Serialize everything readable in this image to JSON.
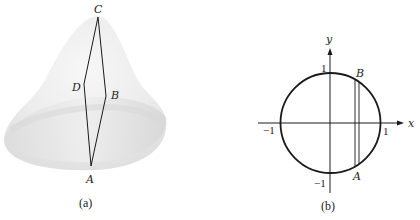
{
  "panel_a": {
    "caption": "(a)",
    "points": {
      "C": "C",
      "D": "D",
      "B": "B",
      "A": "A"
    }
  },
  "panel_b": {
    "caption": "(b)",
    "axes": {
      "x_label": "x",
      "y_label": "y"
    },
    "ticks": {
      "y_pos": "1",
      "y_neg": "−1",
      "x_pos": "1",
      "x_neg": "−1"
    },
    "points": {
      "B": "B",
      "A": "A"
    }
  },
  "colors": {
    "stroke": "#1a1a1a",
    "surface_light": "#f2f2f2",
    "surface_shade": "#dcdcdc"
  }
}
